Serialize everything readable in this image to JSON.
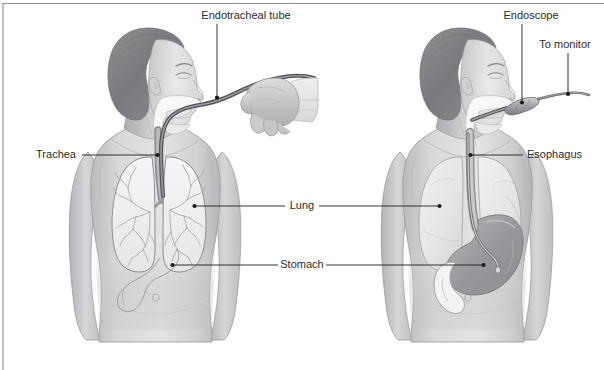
{
  "figure": {
    "panels": [
      {
        "id": "left-panel",
        "name": "endotracheal-intubation-panel",
        "description": "Anterior view of a woman in profile with an endotracheal tube passing through the mouth into the trachea, showing both lungs and the stomach"
      },
      {
        "id": "right-panel",
        "name": "endoscopy-panel",
        "description": "Anterior view of a woman in profile with an endoscope passing through the mouth down the esophagus into the stomach"
      }
    ],
    "labels": {
      "endotracheal_tube": "Endotracheal tube",
      "trachea": "Trachea",
      "lung": "Lung",
      "stomach": "Stomach",
      "endoscope": "Endoscope",
      "to_monitor": "To monitor",
      "esophagus": "Esophagus"
    },
    "colors": {
      "background": "#ffffff",
      "frame": "#8d8d8d",
      "label_text": "#2b2b2b",
      "leader_line": "#1d1d1d",
      "skin_light": "#d9dadb",
      "skin_mid": "#c4c6c8",
      "skin_shadow": "#aeb0b3",
      "hair_dark": "#7f8184",
      "organ_outline": "#8f9194",
      "lung_fill": "#eff0f1",
      "stomach_fill": "#9a9c9f",
      "tube_gray": "#6f7174"
    }
  }
}
